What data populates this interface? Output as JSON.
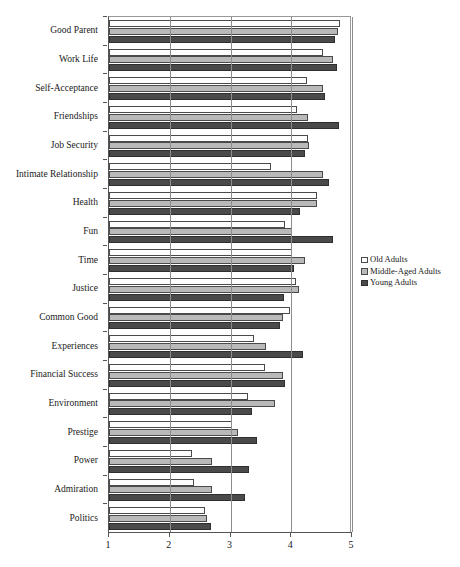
{
  "chart_data": {
    "type": "bar",
    "orientation": "horizontal",
    "title": "",
    "xlabel": "",
    "ylabel": "",
    "xlim": [
      1,
      5
    ],
    "xticks": [
      1,
      2,
      3,
      4,
      5
    ],
    "xticklabels": [
      "1",
      "2",
      "3",
      "4",
      "5"
    ],
    "grid": true,
    "grid_axis": "x",
    "legend_position": "center right",
    "categories": [
      "Good Parent",
      "Work Life",
      "Self-Acceptance",
      "Friendships",
      "Job Security",
      "Intimate Relationship",
      "Health",
      "Fun",
      "Time",
      "Justice",
      "Common Good",
      "Experiences",
      "Financial Success",
      "Environment",
      "Prestige",
      "Power",
      "Admiration",
      "Politics"
    ],
    "series": [
      {
        "name": "Old Adults",
        "color": "#fdfdfd",
        "values": [
          4.8,
          4.53,
          4.26,
          4.1,
          4.28,
          3.66,
          4.42,
          3.9,
          4.02,
          4.08,
          3.98,
          3.38,
          3.57,
          3.28,
          3.02,
          2.36,
          2.4,
          2.58
        ]
      },
      {
        "name": "Middle-Aged Adults",
        "color": "#b9b9b9",
        "values": [
          4.77,
          4.68,
          4.53,
          4.28,
          4.3,
          4.52,
          4.42,
          4.02,
          4.22,
          4.12,
          3.86,
          3.58,
          3.86,
          3.74,
          3.12,
          2.7,
          2.7,
          2.62
        ]
      },
      {
        "name": "Young Adults",
        "color": "#4a4a4a",
        "values": [
          4.72,
          4.76,
          4.55,
          4.78,
          4.22,
          4.62,
          4.14,
          4.68,
          4.04,
          3.88,
          3.82,
          4.2,
          3.9,
          3.36,
          3.44,
          3.3,
          3.24,
          2.68
        ]
      }
    ]
  },
  "legend": {
    "items": [
      {
        "label": "Old Adults",
        "swatch": "s0"
      },
      {
        "label": "Middle-Aged Adults",
        "swatch": "s1"
      },
      {
        "label": "Young Adults",
        "swatch": "s2"
      }
    ]
  },
  "caption": {
    "text": ""
  }
}
